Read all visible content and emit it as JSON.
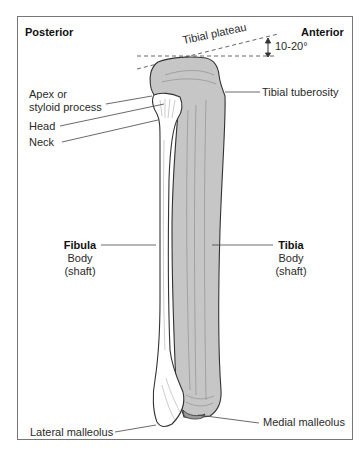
{
  "diagram": {
    "title_left": "Posterior",
    "title_right": "Anterior",
    "plateau_label": "Tibial plateau",
    "angle_label": "10-20°",
    "labels": {
      "apex_line1": "Apex or",
      "apex_line2": "styloid process",
      "head": "Head",
      "neck": "Neck",
      "tibial_tuberosity": "Tibial tuberosity",
      "fibula_title": "Fibula",
      "fibula_body": "Body",
      "fibula_shaft": "(shaft)",
      "tibia_title": "Tibia",
      "tibia_body": "Body",
      "tibia_shaft": "(shaft)",
      "lateral_malleolus": "Lateral malleolus",
      "medial_malleolus": "Medial malleolus"
    },
    "colors": {
      "tibia_fill": "#c6c6c6",
      "fibula_fill": "#ffffff",
      "outline": "#333333",
      "frame": "#777777"
    }
  }
}
